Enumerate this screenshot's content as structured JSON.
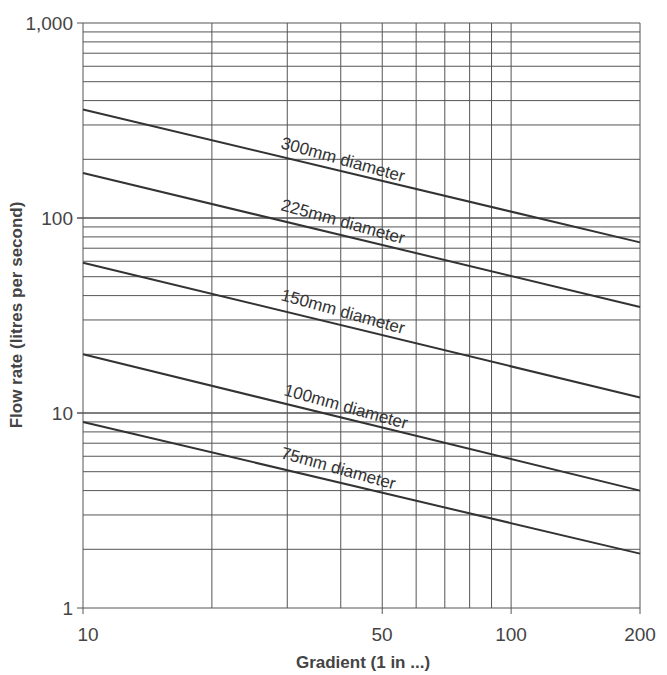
{
  "chart_data": {
    "type": "line",
    "title": "",
    "xlabel": "Gradient (1 in ...)",
    "ylabel": "Flow rate (litres per second)",
    "xscale": "log",
    "yscale": "log",
    "xlim": [
      10,
      200
    ],
    "ylim": [
      1,
      1000
    ],
    "x_ticks": [
      "10",
      "50",
      "100",
      "200"
    ],
    "y_ticks": [
      "1",
      "10",
      "100",
      "1,000"
    ],
    "grid": true,
    "x": [
      10,
      200
    ],
    "series": [
      {
        "name": "300mm diameter",
        "values": [
          360,
          75
        ]
      },
      {
        "name": "225mm diameter",
        "values": [
          170,
          35
        ]
      },
      {
        "name": "150mm diameter",
        "values": [
          59,
          12
        ]
      },
      {
        "name": "100mm diameter",
        "values": [
          20,
          4
        ]
      },
      {
        "name": "75mm diameter",
        "values": [
          9,
          1.9
        ]
      }
    ]
  },
  "labels": {
    "xlabel": "Gradient (1 in ...)",
    "ylabel": "Flow rate (litres per second)",
    "x_ticks": {
      "t10": "10",
      "t50": "50",
      "t100": "100",
      "t200": "200"
    },
    "y_ticks": {
      "t1": "1",
      "t10": "10",
      "t100": "100",
      "t1000": "1,000"
    },
    "series": {
      "s300": "300mm diameter",
      "s225": "225mm diameter",
      "s150": "150mm diameter",
      "s100": "100mm diameter",
      "s75": "75mm diameter"
    }
  },
  "colors": {
    "grid": "#555555",
    "line": "#333333",
    "text": "#444444"
  }
}
